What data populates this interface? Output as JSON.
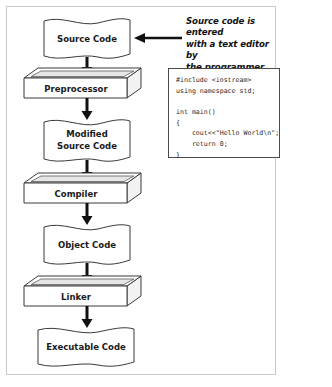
{
  "figure": {
    "background_color": "#ffffff",
    "border_color": "#c9c9c9",
    "stroke_color": "#3a3a3a",
    "arrow_color": "#111111"
  },
  "flow": {
    "nodes": [
      {
        "id": "source-code",
        "shape": "wavy-document",
        "label": "Source Code",
        "lines": [
          "Source Code"
        ]
      },
      {
        "id": "preprocessor",
        "shape": "three-d-box",
        "label": "Preprocessor",
        "lines": [
          "Preprocessor"
        ]
      },
      {
        "id": "modified-source-code",
        "shape": "wavy-document",
        "label": "Modified Source Code",
        "lines": [
          "Modified",
          "Source Code"
        ]
      },
      {
        "id": "compiler",
        "shape": "three-d-box",
        "label": "Compiler",
        "lines": [
          "Compiler"
        ]
      },
      {
        "id": "object-code",
        "shape": "wavy-document",
        "label": "Object Code",
        "lines": [
          "Object Code"
        ]
      },
      {
        "id": "linker",
        "shape": "three-d-box",
        "label": "Linker",
        "lines": [
          "Linker"
        ]
      },
      {
        "id": "executable-code",
        "shape": "wavy-document",
        "label": "Executable Code",
        "lines": [
          "Executable Code"
        ]
      }
    ],
    "connectors": [
      {
        "from": "source-code",
        "to": "preprocessor",
        "direction": "down"
      },
      {
        "from": "preprocessor",
        "to": "modified-source-code",
        "direction": "down"
      },
      {
        "from": "modified-source-code",
        "to": "compiler",
        "direction": "down"
      },
      {
        "from": "compiler",
        "to": "object-code",
        "direction": "down"
      },
      {
        "from": "object-code",
        "to": "linker",
        "direction": "down"
      },
      {
        "from": "linker",
        "to": "executable-code",
        "direction": "down"
      }
    ]
  },
  "annotation": {
    "target": "source-code",
    "direction": "left",
    "lines": [
      "Source code is entered",
      "with a text editor by",
      "the programmer."
    ],
    "text": "Source code is entered with a text editor by the programmer."
  },
  "code_sample": {
    "language": "cpp",
    "lines": [
      "#include <iostream>",
      "using namespace std;",
      "",
      "int main()",
      "{",
      "    cout<<\"Hello World\\n\";",
      "    return 0;",
      "}"
    ]
  }
}
